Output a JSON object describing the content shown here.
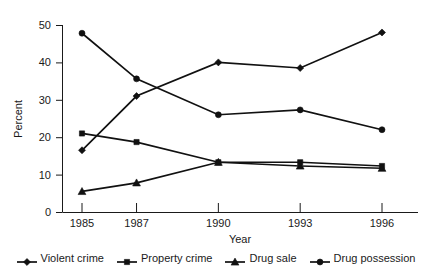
{
  "chart_data": {
    "type": "line",
    "title": "",
    "xlabel": "Year",
    "ylabel": "Percent",
    "categories": [
      "1985",
      "1987",
      "1990",
      "1993",
      "1996"
    ],
    "x": [
      1985,
      1987,
      1990,
      1993,
      1996
    ],
    "ylim": [
      0,
      50
    ],
    "yticks": [
      0,
      10,
      20,
      30,
      40,
      50
    ],
    "ytick_labels": [
      "0",
      "10",
      "20",
      "30",
      "40",
      "50"
    ],
    "grid": false,
    "legend_position": "bottom",
    "series": [
      {
        "name": "Violent crime",
        "marker": "diamond",
        "color": "#111111",
        "values": [
          16.5,
          31.0,
          40.0,
          38.5,
          48.0
        ]
      },
      {
        "name": "Property crime",
        "marker": "square",
        "color": "#111111",
        "values": [
          21.0,
          18.7,
          13.3,
          13.3,
          12.3
        ]
      },
      {
        "name": "Drug sale",
        "marker": "triangle",
        "color": "#111111",
        "values": [
          5.5,
          7.8,
          13.3,
          12.3,
          11.7
        ]
      },
      {
        "name": "Drug possession",
        "marker": "circle",
        "color": "#111111",
        "values": [
          47.8,
          35.6,
          26.0,
          27.3,
          22.0
        ]
      }
    ]
  },
  "axes": {
    "y_title": "Percent",
    "x_title": "Year"
  },
  "legend": {
    "items": [
      {
        "label": "Violent crime",
        "marker": "diamond"
      },
      {
        "label": "Property crime",
        "marker": "square"
      },
      {
        "label": "Drug sale",
        "marker": "triangle"
      },
      {
        "label": "Drug possession",
        "marker": "circle"
      }
    ]
  }
}
